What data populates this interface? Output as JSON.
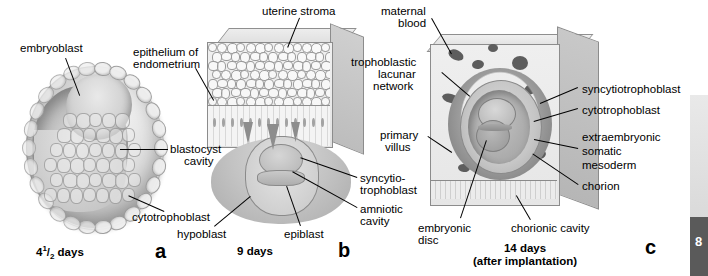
{
  "figure": {
    "panels": [
      {
        "letter": "a",
        "caption": "4 1/2 days",
        "caption_number": "4",
        "caption_fraction_num": "1",
        "caption_fraction_den": "2",
        "caption_unit": "days",
        "labels": [
          {
            "text": "embryoblast",
            "name": "label-embryoblast"
          },
          {
            "text": "blastocyst\ncavity",
            "name": "label-blastocyst-cavity"
          },
          {
            "text": "cytotrophoblast",
            "name": "label-cytotrophoblast-a"
          }
        ]
      },
      {
        "letter": "b",
        "caption": "9 days",
        "labels": [
          {
            "text": "uterine stroma",
            "name": "label-uterine-stroma"
          },
          {
            "text": "epithelium of\nendometrium",
            "name": "label-epithelium-of-endometrium"
          },
          {
            "text": "syncytio-\ntrophoblast",
            "name": "label-syncytiotrophoblast-b"
          },
          {
            "text": "amniotic\ncavity",
            "name": "label-amniotic-cavity"
          },
          {
            "text": "hypoblast",
            "name": "label-hypoblast"
          },
          {
            "text": "epiblast",
            "name": "label-epiblast"
          }
        ]
      },
      {
        "letter": "c",
        "caption_line1": "14 days",
        "caption_line2": "(after implantation)",
        "labels": [
          {
            "text": "maternal\nblood",
            "name": "label-maternal-blood"
          },
          {
            "text": "trophoblastic\nlacunar\nnetwork",
            "name": "label-trophoblastic-lacunar-network"
          },
          {
            "text": "primary\nvillus",
            "name": "label-primary-villus"
          },
          {
            "text": "syncytiotrophoblast",
            "name": "label-syncytiotrophoblast-c"
          },
          {
            "text": "cytotrophoblast",
            "name": "label-cytotrophoblast-c"
          },
          {
            "text": "extraembryonic\nsomatic\nmesoderm",
            "name": "label-extraembryonic-somatic-mesoderm"
          },
          {
            "text": "chorion",
            "name": "label-chorion"
          },
          {
            "text": "chorionic cavity",
            "name": "label-chorionic-cavity"
          },
          {
            "text": "embryonic\ndisc",
            "name": "label-embryonic-disc"
          }
        ]
      }
    ]
  },
  "labels_flat": {
    "embryoblast": "embryoblast",
    "blastocyst_cavity_l1": "blastocyst",
    "blastocyst_cavity_l2": "cavity",
    "cytotrophoblast_a": "cytotrophoblast",
    "uterine_stroma": "uterine stroma",
    "epithelium_l1": "epithelium of",
    "epithelium_l2": "endometrium",
    "syncytio_b_l1": "syncytio-",
    "syncytio_b_l2": "trophoblast",
    "amniotic_l1": "amniotic",
    "amniotic_l2": "cavity",
    "hypoblast": "hypoblast",
    "epiblast": "epiblast",
    "maternal_l1": "maternal",
    "maternal_l2": "blood",
    "lacunar_l1": "trophoblastic",
    "lacunar_l2": "lacunar",
    "lacunar_l3": "network",
    "primary_l1": "primary",
    "primary_l2": "villus",
    "syncytiotrophoblast_c": "syncytiotrophoblast",
    "cytotrophoblast_c": "cytotrophoblast",
    "extraembryonic_l1": "extraembryonic",
    "extraembryonic_l2": "somatic",
    "extraembryonic_l3": "mesoderm",
    "chorion": "chorion",
    "chorionic_cavity": "chorionic cavity",
    "embryonic_l1": "embryonic",
    "embryonic_l2": "disc"
  },
  "captions": {
    "a_num": "4",
    "a_frac_num": "1",
    "a_frac_den": "2",
    "a_unit": " days",
    "a_letter": "a",
    "b": "9 days",
    "b_letter": "b",
    "c_l1": "14 days",
    "c_l2": "(after implantation)",
    "c_letter": "c"
  },
  "page_edge": {
    "number": "8"
  },
  "colors": {
    "background": "#ffffff",
    "text": "#000000",
    "leader_line": "#000000",
    "tissue_light": "#efefef",
    "tissue_mid": "#c6c6c6",
    "tissue_dark": "#8a8a8a",
    "lacuna_fill": "#5d5d5d",
    "edge_block": "#5a5a5a"
  }
}
